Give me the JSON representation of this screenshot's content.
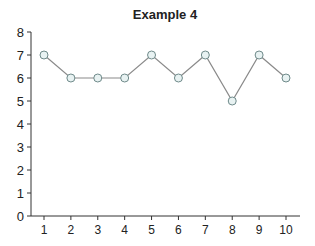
{
  "chart_data": {
    "type": "line",
    "title": "Example 4",
    "xlabel": "",
    "ylabel": "",
    "x": [
      1,
      2,
      3,
      4,
      5,
      6,
      7,
      8,
      9,
      10
    ],
    "series": [
      {
        "name": "Example 4",
        "values": [
          7,
          6,
          6,
          6,
          7,
          6,
          7,
          5,
          7,
          6
        ]
      }
    ],
    "xticks": [
      "1",
      "2",
      "3",
      "4",
      "5",
      "6",
      "7",
      "8",
      "9",
      "10"
    ],
    "yticks": [
      "0",
      "1",
      "2",
      "3",
      "4",
      "5",
      "6",
      "7",
      "8"
    ],
    "ylim": [
      0,
      8
    ],
    "xlim": [
      0.5,
      10.5
    ],
    "grid": false,
    "legend": "none",
    "colors": {
      "line": "#8a8a8a",
      "marker_fill": "#e8f2f2",
      "marker_stroke": "#6f8a8a",
      "axis": "#333333"
    }
  }
}
